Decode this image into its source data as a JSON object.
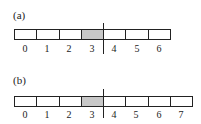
{
  "panels": [
    {
      "label": "(a)",
      "cells": 7,
      "shaded_index": 3,
      "indices": [
        "0",
        "1",
        "2",
        "3",
        "4",
        "5",
        "6"
      ],
      "divider_after_index": 3
    },
    {
      "label": "(b)",
      "cells": 8,
      "shaded_index": 3,
      "indices": [
        "0",
        "1",
        "2",
        "3",
        "4",
        "5",
        "6",
        "7"
      ],
      "divider_after_index": 3
    }
  ],
  "colors": {
    "shaded": "#c8c8c8",
    "line": "#222222"
  }
}
